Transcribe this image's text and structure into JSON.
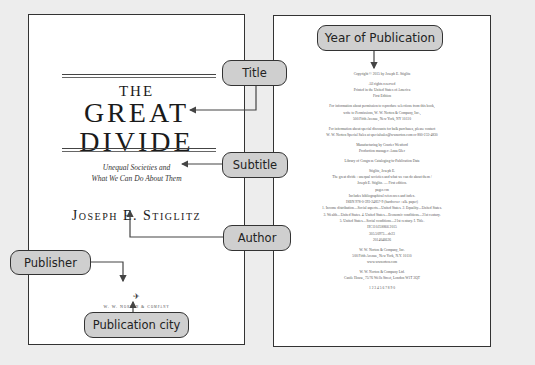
{
  "colors": {
    "background": "#ededed",
    "page": "#ffffff",
    "border": "#333333",
    "callout_fill": "#cfcfcf",
    "arrow": "#444444"
  },
  "callouts": {
    "title": "Title",
    "subtitle": "Subtitle",
    "author": "Author",
    "publisher": "Publisher",
    "publication_city": "Publication city",
    "year": "Year of Publication"
  },
  "title_page": {
    "title_line1": "THE",
    "title_line2": "GREAT",
    "title_line3": "DIVIDE",
    "subtitle_line1": "Unequal Societies and",
    "subtitle_line2": "What We Can Do About Them",
    "author": "Joseph E. Stiglitz",
    "publisher_logo": "✈",
    "publisher": "W. W. Norton & Company",
    "cities": "New York · London"
  },
  "copyright_page": {
    "lines": [
      "Copyright © 2015 by Joseph E. Stiglitz",
      "",
      "All rights reserved",
      "Printed in the United States of America",
      "First Edition",
      "",
      "For information about permission to reproduce selections from this book,",
      "write to Permissions, W. W. Norton & Company, Inc.,",
      "500 Fifth Avenue, New York, NY 10110",
      "",
      "For information about special discounts for bulk purchases, please contact",
      "W. W. Norton Special Sales at specialsales@wwnorton.com or 800-233-4830",
      "",
      "Manufacturing by Courier Westford",
      "Production manager: Anna Oler",
      "",
      "Library of Congress Cataloging-in-Publication Data",
      "",
      "Stiglitz, Joseph E.",
      "The great divide : unequal societies and what we can do about them /",
      "Joseph E. Stiglitz. — First edition.",
      "pages cm",
      "Includes bibliographical references and index.",
      "ISBN 978-0-393-24857-9 (hardcover : alk. paper)",
      "1. Income distribution—Social aspects—United States. 2. Equality—United States.",
      "3. Wealth—United States. 4. United States—Economic conditions—21st century.",
      "5. United States—Social conditions—21st century. I. Title.",
      "HC110.I5S866 2015",
      "305.50973—dc23",
      "2014046626",
      "",
      "W. W. Norton & Company, Inc.",
      "500 Fifth Avenue, New York, N.Y. 10110",
      "www.wwnorton.com",
      "",
      "W. W. Norton & Company Ltd.",
      "Castle House, 75/76 Wells Street, London W1T 3QT",
      "",
      "1 2 3 4 5 6 7 8 9 0"
    ]
  }
}
